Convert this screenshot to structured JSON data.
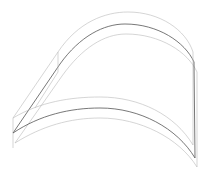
{
  "diagram": {
    "type": "wireframe-3d-curved-shell",
    "colors": {
      "background": "#ffffff",
      "light_edge": "#b8b8b8",
      "dark_edge": "#555555"
    }
  }
}
